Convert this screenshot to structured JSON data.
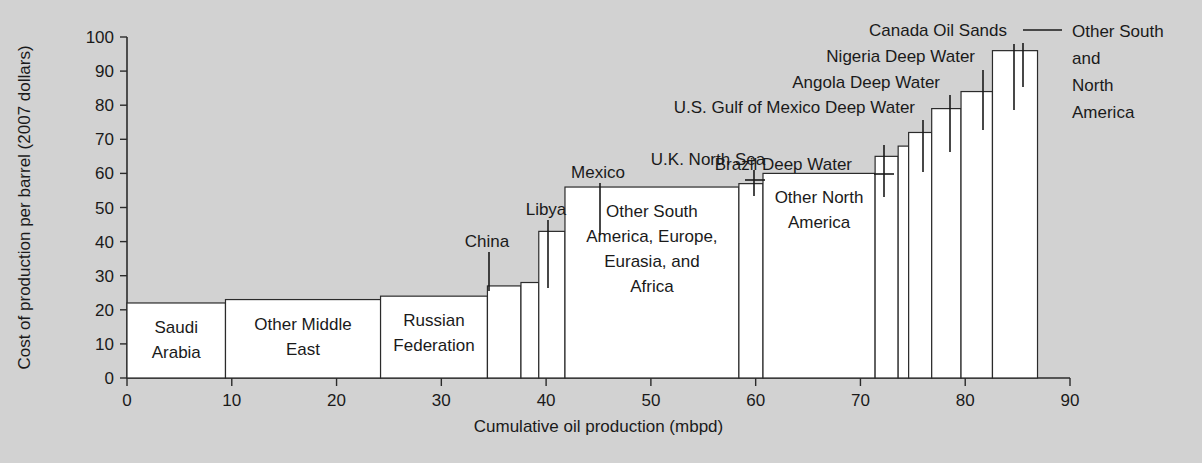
{
  "chart_data": {
    "type": "bar",
    "title": "",
    "xlabel": "Cumulative oil production (mbpd)",
    "ylabel": "Cost of production per barrel (2007 dollars)",
    "xlim": [
      0,
      90
    ],
    "ylim": [
      0,
      100
    ],
    "xticks": [
      0,
      10,
      20,
      30,
      40,
      50,
      60,
      70,
      80,
      90
    ],
    "yticks": [
      0,
      10,
      20,
      30,
      40,
      50,
      60,
      70,
      80,
      90,
      100
    ],
    "grid": false,
    "legend": "none",
    "note": "Supply-curve style variable-width bar chart: each bar's width is that region's production in mbpd (cumulative along x), each bar's height is its cost of production per barrel.",
    "bars": [
      {
        "name": "Saudi Arabia",
        "x_start": 0,
        "x_end": 9.4,
        "width": 9.4,
        "value": 22,
        "label_mode": "inside",
        "label_lines": [
          "Saudi",
          "Arabia"
        ]
      },
      {
        "name": "Other Middle East",
        "x_start": 9.4,
        "x_end": 24.2,
        "width": 14.8,
        "value": 23,
        "label_mode": "inside",
        "label_lines": [
          "Other Middle",
          "East"
        ]
      },
      {
        "name": "Russian Federation",
        "x_start": 24.2,
        "x_end": 34.4,
        "width": 10.2,
        "value": 24,
        "label_mode": "inside",
        "label_lines": [
          "Russian",
          "Federation"
        ]
      },
      {
        "name": "China",
        "x_start": 34.4,
        "x_end": 37.6,
        "width": 3.2,
        "value": 27,
        "label_mode": "callout",
        "label_lines": [
          "China"
        ]
      },
      {
        "name": "Libya",
        "x_start": 37.6,
        "x_end": 39.3,
        "width": 1.7,
        "value": 28,
        "label_mode": "callout",
        "label_lines": [
          "Libya"
        ]
      },
      {
        "name": "Mexico",
        "x_start": 39.3,
        "x_end": 41.8,
        "width": 2.5,
        "value": 43,
        "label_mode": "callout",
        "label_lines": [
          "Mexico"
        ]
      },
      {
        "name": "Other South America, Europe, Eurasia, and Africa",
        "x_start": 41.8,
        "x_end": 58.4,
        "width": 16.6,
        "value": 56,
        "label_mode": "inside",
        "label_lines": [
          "Other South",
          "America, Europe,",
          "Eurasia, and",
          "Africa"
        ]
      },
      {
        "name": "U.K. North Sea",
        "x_start": 58.4,
        "x_end": 60.7,
        "width": 2.3,
        "value": 57,
        "label_mode": "callout",
        "label_lines": [
          "U.K. North Sea"
        ]
      },
      {
        "name": "Other North America",
        "x_start": 60.7,
        "x_end": 71.4,
        "width": 10.7,
        "value": 60,
        "label_mode": "inside",
        "label_lines": [
          "Other North",
          "America"
        ]
      },
      {
        "name": "Brazil Deep Water",
        "x_start": 71.4,
        "x_end": 73.6,
        "width": 2.2,
        "value": 65,
        "label_mode": "callout",
        "label_lines": [
          "Brazil Deep Water"
        ]
      },
      {
        "name": "U.S. Gulf of Mexico Deep Water",
        "x_start": 73.6,
        "x_end": 74.6,
        "width": 1.0,
        "value": 68,
        "label_mode": "callout",
        "label_lines": [
          "U.S. Gulf of Mexico Deep Water"
        ]
      },
      {
        "name": "Angola Deep Water",
        "x_start": 74.6,
        "x_end": 76.8,
        "width": 2.2,
        "value": 72,
        "label_mode": "callout",
        "label_lines": [
          "Angola Deep Water"
        ]
      },
      {
        "name": "Nigeria Deep Water",
        "x_start": 76.8,
        "x_end": 79.6,
        "width": 2.8,
        "value": 79,
        "label_mode": "callout",
        "label_lines": [
          "Nigeria Deep Water"
        ]
      },
      {
        "name": "Canada Oil Sands",
        "x_start": 79.6,
        "x_end": 82.6,
        "width": 3.0,
        "value": 84,
        "label_mode": "callout",
        "label_lines": [
          "Canada Oil Sands"
        ]
      },
      {
        "name": "Other South and North America",
        "x_start": 82.6,
        "x_end": 86.9,
        "width": 4.3,
        "value": 96,
        "label_mode": "callout",
        "label_lines": [
          "Other South",
          "and",
          "North",
          "America"
        ]
      }
    ]
  },
  "axes": {
    "y_title": "Cost of production per barrel (2007 dollars)",
    "x_title": "Cumulative oil production (mbpd)",
    "x_tick_labels": [
      "0",
      "10",
      "20",
      "30",
      "40",
      "50",
      "60",
      "70",
      "80",
      "90"
    ],
    "y_tick_labels": [
      "0",
      "10",
      "20",
      "30",
      "40",
      "50",
      "60",
      "70",
      "80",
      "90",
      "100"
    ]
  },
  "colors": {
    "background": "#d2d2d2",
    "bar_fill": "#ffffff",
    "bar_stroke": "#2b2b2b",
    "text": "#1a1a1a",
    "axis": "#2b2b2b"
  }
}
